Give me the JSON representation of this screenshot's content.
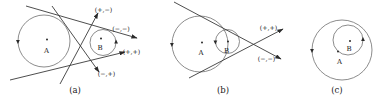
{
  "colors": {
    "background": "#ffffff",
    "tangent_line": "#3a3a3a",
    "circle_stroke": "#6f6f6f",
    "text": "#1a1a1a"
  },
  "panels": {
    "a": {
      "caption": "(a)",
      "label_circle_a": "A",
      "label_circle_b": "B",
      "tangents": {
        "internal_up": "(+,−)",
        "external_top": "(−,−)",
        "external_bottom": "(+,+)",
        "internal_down": "(−,+)"
      }
    },
    "b": {
      "caption": "(b)",
      "label_circle_a": "A",
      "label_circle_b": "B",
      "tangents": {
        "upper": "(+,+)",
        "lower": "(−,−)"
      }
    },
    "c": {
      "caption": "(c)",
      "label_circle_a": "A",
      "label_circle_b": "B"
    }
  }
}
